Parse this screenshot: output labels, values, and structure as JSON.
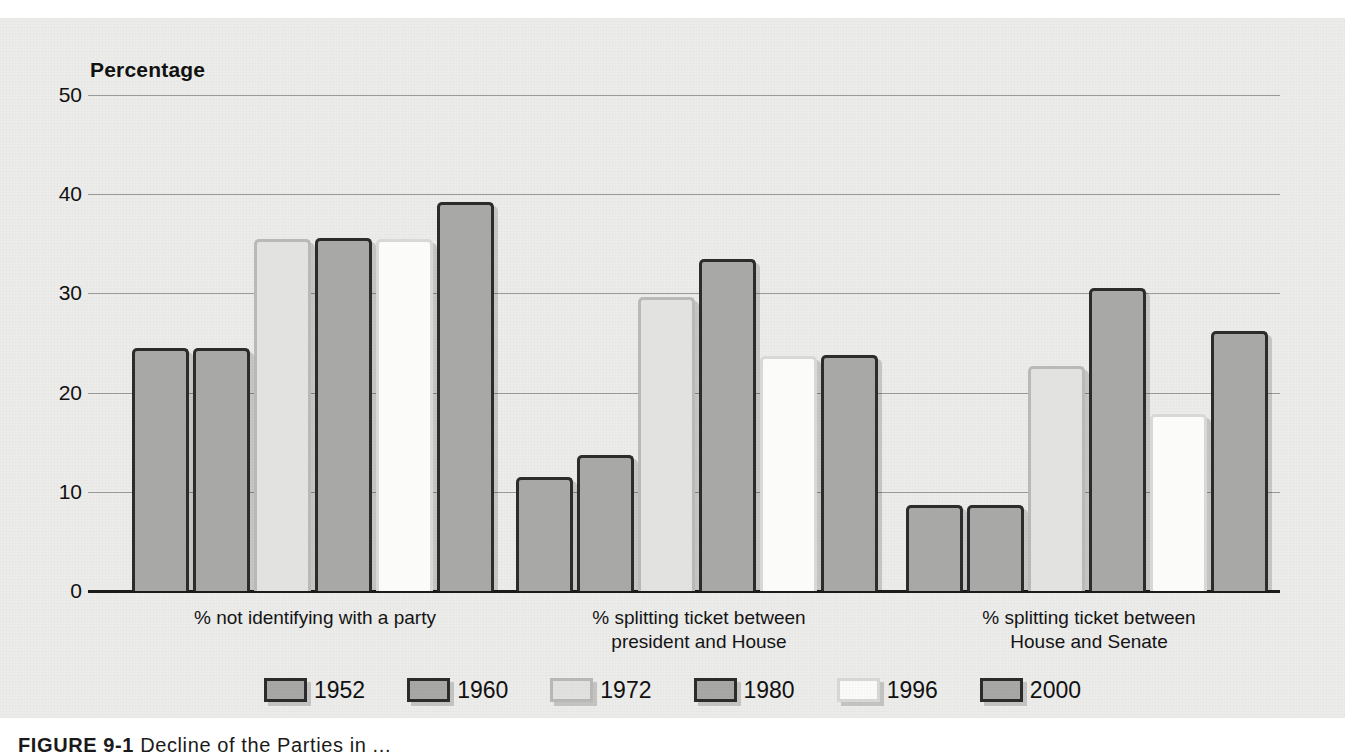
{
  "figure": {
    "background_color": "#ececeb",
    "caption_label": "FIGURE 9-1",
    "caption_text": "Decline of the Parties in ..."
  },
  "axis": {
    "y_title": "Percentage",
    "y_ticks": [
      "50",
      "40",
      "30",
      "20",
      "10",
      "0"
    ]
  },
  "legend": {
    "position": "bottom-center",
    "items": [
      {
        "label": "1952",
        "style": "sA",
        "swatch_fill": "#a8a8a6",
        "swatch_border": "#2c2c2c"
      },
      {
        "label": "1960",
        "style": "sA",
        "swatch_fill": "#a8a8a6",
        "swatch_border": "#2c2c2c"
      },
      {
        "label": "1972",
        "style": "sB",
        "swatch_fill": "#e2e2e0",
        "swatch_border": "#b9b9b7"
      },
      {
        "label": "1980",
        "style": "sA",
        "swatch_fill": "#a8a8a6",
        "swatch_border": "#2c2c2c"
      },
      {
        "label": "1996",
        "style": "sC",
        "swatch_fill": "#fbfbfa",
        "swatch_border": "#d8d8d6"
      },
      {
        "label": "2000",
        "style": "sA",
        "swatch_fill": "#a8a8a6",
        "swatch_border": "#2c2c2c"
      }
    ]
  },
  "chart_data": {
    "type": "bar",
    "title": "",
    "xlabel": "",
    "ylabel": "Percentage",
    "ylim": [
      0,
      50
    ],
    "yticks": [
      0,
      10,
      20,
      30,
      40,
      50
    ],
    "grid": true,
    "legend_position": "bottom-center",
    "categories": [
      "% not identifying with a party",
      "% splitting ticket between\npresident and House",
      "% splitting ticket between\nHouse and Senate"
    ],
    "series": [
      {
        "name": "1952",
        "style": "sA",
        "values": [
          24.5,
          11.5,
          8.7
        ]
      },
      {
        "name": "1960",
        "style": "sA",
        "values": [
          24.5,
          13.7,
          8.7
        ]
      },
      {
        "name": "1972",
        "style": "sB",
        "values": [
          35.5,
          29.6,
          22.7
        ]
      },
      {
        "name": "1980",
        "style": "sA",
        "values": [
          35.6,
          33.5,
          30.5
        ]
      },
      {
        "name": "1996",
        "style": "sC",
        "values": [
          35.5,
          23.7,
          17.8
        ]
      },
      {
        "name": "2000",
        "style": "sA",
        "values": [
          39.2,
          23.8,
          26.2
        ]
      }
    ]
  }
}
